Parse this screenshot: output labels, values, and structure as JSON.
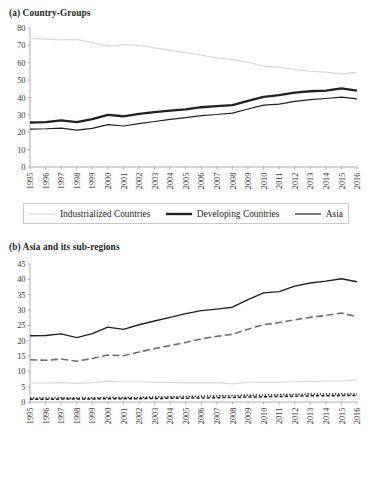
{
  "figure": {
    "panels": [
      {
        "id": "a",
        "title": "(a) Country-Groups"
      },
      {
        "id": "b",
        "title": "(b) Asia and its sub-regions"
      }
    ]
  },
  "colors": {
    "dark": "#231f20",
    "medium": "#6d6e71",
    "light": "#d9d9d9",
    "axis": "#9a9a9a",
    "tick_text": "#3a3a3a",
    "legend_border": "#c9c9c9"
  },
  "chart_data": [
    {
      "type": "line",
      "title": "(a) Country-Groups",
      "xlabel": "",
      "ylabel": "",
      "ylim": [
        0,
        80
      ],
      "yticks": [
        0,
        10,
        20,
        30,
        40,
        50,
        60,
        70,
        80
      ],
      "grid": false,
      "legend_position": "bottom",
      "x": [
        1995,
        1996,
        1997,
        1998,
        1999,
        2000,
        2001,
        2002,
        2003,
        2004,
        2005,
        2006,
        2007,
        2008,
        2009,
        2010,
        2011,
        2012,
        2013,
        2014,
        2015,
        2016
      ],
      "categories": [
        "1995",
        "1996",
        "1997",
        "1998",
        "1999",
        "2000",
        "2001",
        "2002",
        "2003",
        "2004",
        "2005",
        "2006",
        "2007",
        "2008",
        "2009",
        "2010",
        "2011",
        "2012",
        "2013",
        "2014",
        "2015",
        "2016"
      ],
      "series": [
        {
          "name": "Industrialized Countries",
          "style": "solid-light",
          "color": "#d9d9d9",
          "width": 1.3,
          "values": [
            74.0,
            73.6,
            73.2,
            73.4,
            71.6,
            69.6,
            70.4,
            70.0,
            68.6,
            67.2,
            65.8,
            64.4,
            62.8,
            61.8,
            60.2,
            58.0,
            57.4,
            56.0,
            55.2,
            54.6,
            53.6,
            54.4
          ]
        },
        {
          "name": "Developing Countries",
          "style": "solid-bold",
          "color": "#231f20",
          "width": 2.3,
          "values": [
            25.6,
            25.8,
            26.8,
            25.8,
            27.6,
            30.0,
            29.2,
            30.6,
            31.6,
            32.4,
            33.2,
            34.4,
            35.0,
            35.6,
            38.0,
            40.4,
            41.4,
            42.8,
            43.6,
            44.0,
            45.2,
            44.0
          ]
        },
        {
          "name": "Asia",
          "style": "solid-thin",
          "color": "#231f20",
          "width": 1.15,
          "values": [
            21.8,
            22.0,
            22.4,
            21.2,
            22.2,
            24.4,
            23.6,
            25.0,
            26.2,
            27.4,
            28.4,
            29.6,
            30.2,
            31.0,
            33.4,
            35.6,
            36.2,
            37.8,
            38.8,
            39.4,
            40.2,
            39.2
          ]
        }
      ]
    },
    {
      "type": "line",
      "title": "(b) Asia and its sub-regions",
      "xlabel": "",
      "ylabel": "",
      "ylim": [
        0,
        45
      ],
      "yticks": [
        0,
        5,
        10,
        15,
        20,
        25,
        30,
        35,
        40,
        45
      ],
      "grid": false,
      "legend_position": "bottom",
      "x": [
        1995,
        1996,
        1997,
        1998,
        1999,
        2000,
        2001,
        2002,
        2003,
        2004,
        2005,
        2006,
        2007,
        2008,
        2009,
        2010,
        2011,
        2012,
        2013,
        2014,
        2015,
        2016
      ],
      "categories": [
        "1995",
        "1996",
        "1997",
        "1998",
        "1999",
        "2000",
        "2001",
        "2002",
        "2003",
        "2004",
        "2005",
        "2006",
        "2007",
        "2008",
        "2009",
        "2010",
        "2011",
        "2012",
        "2013",
        "2014",
        "2015",
        "2016"
      ],
      "series": [
        {
          "name": "Asia",
          "style": "solid-dark",
          "color": "#231f20",
          "width": 1.4,
          "values": [
            21.6,
            21.7,
            22.2,
            21.0,
            22.3,
            24.4,
            23.7,
            25.2,
            26.4,
            27.6,
            28.8,
            29.8,
            30.3,
            30.9,
            33.4,
            35.6,
            36.0,
            37.8,
            38.8,
            39.4,
            40.2,
            39.2
          ]
        },
        {
          "name": "East Asia",
          "style": "dashed-long",
          "color": "#6d6e71",
          "width": 1.6,
          "values": [
            13.8,
            13.6,
            14.0,
            13.3,
            14.2,
            15.3,
            15.1,
            16.3,
            17.4,
            18.4,
            19.4,
            20.6,
            21.4,
            22.1,
            23.7,
            25.2,
            25.9,
            26.8,
            27.6,
            28.2,
            29.0,
            27.8
          ]
        },
        {
          "name": "Southeast Asia",
          "style": "solid-light",
          "color": "#d9d9d9",
          "width": 1.2,
          "values": [
            6.2,
            6.2,
            6.3,
            6.1,
            6.3,
            6.8,
            6.6,
            6.6,
            6.5,
            6.4,
            6.3,
            6.3,
            6.3,
            5.9,
            6.4,
            6.5,
            6.5,
            6.6,
            6.7,
            6.8,
            6.9,
            7.2
          ]
        },
        {
          "name": "South Asia",
          "style": "dashed-short",
          "color": "#231f20",
          "width": 1.5,
          "values": [
            0.9,
            0.9,
            0.95,
            0.95,
            1.0,
            1.05,
            1.05,
            1.1,
            1.15,
            1.2,
            1.25,
            1.3,
            1.4,
            1.5,
            1.6,
            1.7,
            1.8,
            1.9,
            2.0,
            2.0,
            2.1,
            2.1
          ]
        },
        {
          "name": "West Asia",
          "style": "dotted",
          "color": "#231f20",
          "width": 1.5,
          "values": [
            1.3,
            1.3,
            1.35,
            1.3,
            1.35,
            1.5,
            1.45,
            1.5,
            1.6,
            1.7,
            1.8,
            1.9,
            2.0,
            2.1,
            2.2,
            2.3,
            2.4,
            2.5,
            2.6,
            2.6,
            2.65,
            2.6
          ]
        }
      ]
    }
  ],
  "legends": {
    "a": {
      "items": [
        {
          "label": "Industrialized Countries",
          "swatch": "solid-light"
        },
        {
          "label": "Developing Countries",
          "swatch": "solid-bold"
        },
        {
          "label": "Asia",
          "swatch": "solid-thin"
        }
      ]
    },
    "b": {
      "row1": [
        {
          "label": "Asia",
          "swatch": "solid-dark"
        },
        {
          "label": "East Asia",
          "swatch": "dashed-long"
        },
        {
          "label": "Southeast Asia",
          "swatch": "solid-light"
        }
      ],
      "row2": [
        {
          "label": "South Asia",
          "swatch": "dashed-short"
        },
        {
          "label": "West Asia",
          "swatch": "dotted"
        }
      ]
    }
  }
}
